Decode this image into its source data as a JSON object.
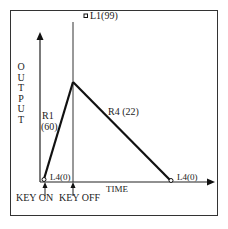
{
  "diagram": {
    "type": "envelope-generator",
    "axes": {
      "y_label": "OUTPUT",
      "x_label": "TIME"
    },
    "markers": {
      "key_on": "KEY ON",
      "key_off": "KEY OFF"
    },
    "points": [
      {
        "id": "start",
        "label": "L4(0)"
      },
      {
        "id": "l1",
        "label": "L1(99)"
      },
      {
        "id": "end",
        "label": "L4(0)"
      }
    ],
    "segments": [
      {
        "id": "r1",
        "label_line1": "R1",
        "label_line2": "(60)"
      },
      {
        "id": "r4",
        "label": "R4 (22)"
      }
    ]
  },
  "colors": {
    "line": "#1a1a1a",
    "frame": "#333333",
    "background": "#ffffff"
  }
}
